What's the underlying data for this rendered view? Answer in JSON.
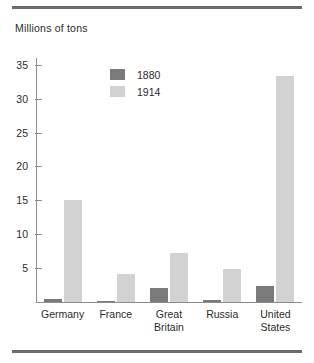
{
  "figure": {
    "axis_title": "Millions of tons"
  },
  "legend": {
    "position": "inside-top-left",
    "entries": [
      {
        "label": "1880",
        "color": "#7a7a7a"
      },
      {
        "label": "1914",
        "color": "#d2d2d2"
      }
    ]
  },
  "chart_data": {
    "type": "bar",
    "title": "Millions of tons",
    "xlabel": "",
    "ylabel": "Millions of tons",
    "categories": [
      "Germany",
      "France",
      "Great\nBritain",
      "Russia",
      "United\nStates"
    ],
    "series": [
      {
        "name": "1880",
        "color": "#7a7a7a",
        "values": [
          0.5,
          0.2,
          2.1,
          0.3,
          2.3
        ]
      },
      {
        "name": "1914",
        "color": "#d2d2d2",
        "values": [
          15.1,
          4.2,
          7.3,
          4.8,
          33.3
        ]
      }
    ],
    "ylim": [
      0,
      36
    ],
    "yticks": [
      5,
      10,
      15,
      20,
      25,
      30,
      35
    ],
    "ytick_labels": [
      "5",
      "10",
      "15",
      "20",
      "25",
      "30",
      "35"
    ],
    "grid": false,
    "legend_position": "upper left inside"
  },
  "colors": {
    "series_1880": "#7a7a7a",
    "series_1914": "#d2d2d2",
    "axis": "#8c8c8c",
    "rule": "#6b6b6b",
    "text": "#2b2b2b",
    "background": "#ffffff"
  }
}
